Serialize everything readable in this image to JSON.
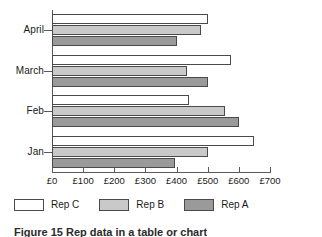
{
  "chart_data": {
    "type": "bar",
    "orientation": "horizontal",
    "title": "",
    "xlabel": "",
    "ylabel": "",
    "categories": [
      "April",
      "March",
      "Feb",
      "Jan"
    ],
    "series": [
      {
        "name": "Rep C",
        "color": "#ffffff",
        "values": [
          500,
          575,
          440,
          650
        ]
      },
      {
        "name": "Rep B",
        "color": "#c9c9c9",
        "values": [
          480,
          435,
          555,
          500
        ]
      },
      {
        "name": "Rep A",
        "color": "#9a9a9a",
        "values": [
          400,
          500,
          600,
          395
        ]
      }
    ],
    "xlim": [
      0,
      700
    ],
    "xticks": [
      0,
      100,
      200,
      300,
      400,
      500,
      600,
      700
    ],
    "xtick_labels": [
      "£0",
      "£100",
      "£200",
      "£300",
      "£400",
      "£500",
      "£600",
      "£700"
    ],
    "grid": false,
    "legend_position": "bottom-left",
    "currency_symbol": "£"
  },
  "legend": {
    "items": [
      {
        "label": "Rep C",
        "color": "#ffffff"
      },
      {
        "label": "Rep B",
        "color": "#c9c9c9"
      },
      {
        "label": "Rep A",
        "color": "#9a9a9a"
      }
    ]
  },
  "caption": {
    "text": "Figure 15 Rep data in a table or chart"
  }
}
